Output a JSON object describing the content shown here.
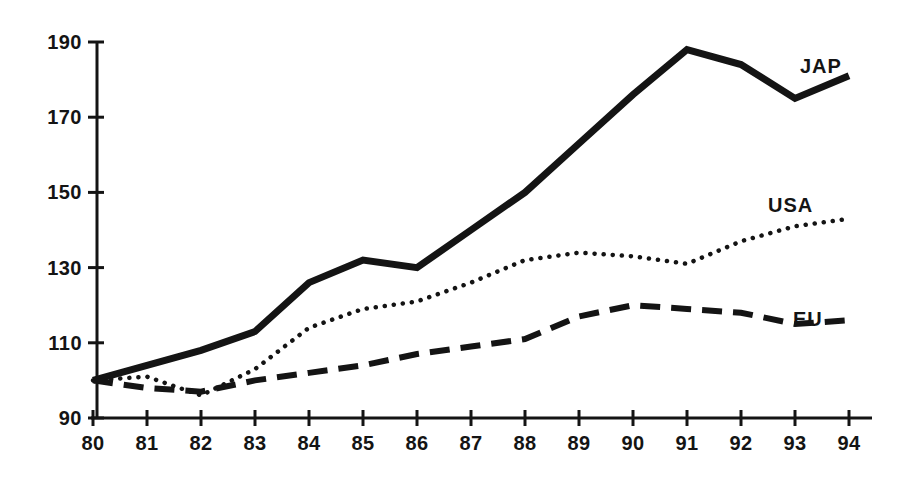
{
  "chart_data": {
    "type": "line",
    "title": "",
    "subtitle": "",
    "xlabel": "",
    "ylabel": "",
    "x": [
      "80",
      "81",
      "82",
      "83",
      "84",
      "85",
      "86",
      "87",
      "88",
      "89",
      "90",
      "91",
      "92",
      "93",
      "94"
    ],
    "xtick_labels": [
      "80",
      "81",
      "82",
      "83",
      "84",
      "85",
      "86",
      "87",
      "88",
      "89",
      "90",
      "91",
      "92",
      "93",
      "94"
    ],
    "ytick_labels": [
      "90",
      "110",
      "130",
      "150",
      "170",
      "190"
    ],
    "yticks": [
      90,
      110,
      130,
      150,
      170,
      190
    ],
    "ylim": [
      90,
      190
    ],
    "xlim": [
      "80",
      "94"
    ],
    "grid": false,
    "legend_position": "inline-right-of-series",
    "series": [
      {
        "name": "JAP",
        "label": "JAP",
        "style": "solid",
        "color": "#141414",
        "values": [
          100,
          104,
          108,
          113,
          126,
          132,
          130,
          140,
          150,
          163,
          176,
          188,
          184,
          175,
          181
        ]
      },
      {
        "name": "USA",
        "label": "USA",
        "style": "dotted",
        "color": "#141414",
        "values": [
          100,
          101,
          96,
          103,
          114,
          119,
          121,
          126,
          132,
          134,
          133,
          131,
          137,
          141,
          143
        ]
      },
      {
        "name": "EU",
        "label": "EU",
        "style": "dashed",
        "color": "#141414",
        "values": [
          100,
          98,
          97,
          100,
          102,
          104,
          107,
          109,
          111,
          117,
          120,
          119,
          118,
          115,
          116
        ]
      }
    ],
    "annotations": [
      {
        "text": "JAP",
        "series": "JAP",
        "x": 800,
        "y": 55
      },
      {
        "text": "USA",
        "series": "USA",
        "x": 768,
        "y": 194
      },
      {
        "text": "EU",
        "series": "EU",
        "x": 793,
        "y": 308
      }
    ]
  },
  "axis": {
    "line_color": "#141414",
    "tick_color": "#141414"
  }
}
